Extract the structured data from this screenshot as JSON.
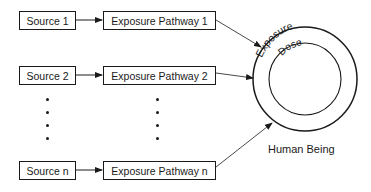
{
  "diagram": {
    "sources": [
      {
        "label": "Source 1"
      },
      {
        "label": "Source 2"
      },
      {
        "label": "Source n"
      }
    ],
    "pathways": [
      {
        "label": "Exposure Pathway 1"
      },
      {
        "label": "Exposure Pathway 2"
      },
      {
        "label": "Exposure Pathway n"
      }
    ],
    "target": {
      "label": "Human Being",
      "outer_ring_label": "Exposure",
      "inner_ring_label": "Dose"
    },
    "ellipsis": "vertical dots indicating additional sources and pathways"
  }
}
